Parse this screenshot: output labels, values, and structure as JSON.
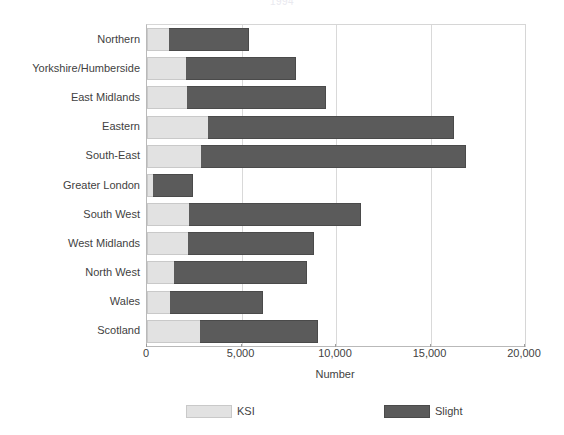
{
  "chart_data": {
    "type": "bar",
    "orientation": "horizontal",
    "stacked": true,
    "title": "1994",
    "xlabel": "Number",
    "ylabel": "",
    "xlim": [
      0,
      20000
    ],
    "grid": true,
    "gridlines_x": [
      5000,
      10000,
      15000
    ],
    "xticks": [
      0,
      5000,
      10000,
      15000,
      20000
    ],
    "xtick_labels": [
      "0",
      "5,000",
      "10,000",
      "15,000",
      "20,000"
    ],
    "legend_position": "bottom",
    "categories": [
      "Northern",
      "Yorkshire/Humberside",
      "East Midlands",
      "Eastern",
      "South-East",
      "Greater London",
      "South West",
      "West Midlands",
      "North West",
      "Wales",
      "Scotland"
    ],
    "series": [
      {
        "name": "KSI",
        "color": "#e2e2e2",
        "values": [
          1160,
          2060,
          2120,
          3230,
          2860,
          320,
          2220,
          2170,
          1430,
          1220,
          2800
        ]
      },
      {
        "name": "Slight",
        "color": "#5b5b5b",
        "values": [
          4240,
          5820,
          7350,
          13010,
          14020,
          2110,
          9100,
          6670,
          7040,
          4920,
          6250
        ]
      }
    ],
    "totals": [
      5400,
      7880,
      9470,
      16240,
      16880,
      2430,
      11320,
      8840,
      8470,
      6140,
      9050
    ]
  },
  "legend": {
    "items": [
      {
        "label": "KSI",
        "swatch": "ksi"
      },
      {
        "label": "Slight",
        "swatch": "slight"
      }
    ]
  },
  "axis": {
    "x_title": "Number"
  }
}
